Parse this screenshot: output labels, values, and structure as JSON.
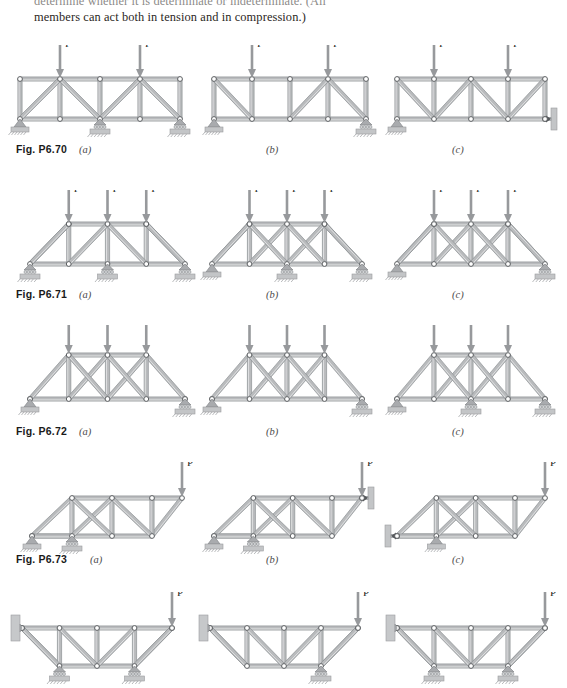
{
  "intro": {
    "line1": "determine whether it is determinate or indeterminate. (All",
    "line2": "members can act both in tension and in compression.)"
  },
  "load_label": "P",
  "colors": {
    "member": "#b9bbbd",
    "member_edge": "#8d9093",
    "joint_fill": "#ffffff",
    "joint_edge": "#5d6063",
    "support": "#a9abae",
    "arrow": "#97999c",
    "text": "#231f20"
  },
  "rows": [
    {
      "id": "p6-70",
      "fig_label": "Fig. P6.70",
      "fig_label_x": 16,
      "fig_label_y": 143,
      "top": 45,
      "panels": [
        {
          "id": "p6-70-a",
          "sub": "(a)",
          "sub_x": 79,
          "sub_y": 144,
          "x": 6,
          "type": "parallel-chord",
          "bays": 4,
          "span": 160,
          "height": 40,
          "diagonals": [
            "/",
            "\\",
            "/",
            "\\"
          ],
          "loads": [
            1,
            3
          ],
          "supports": [
            {
              "node": "bottom-0",
              "kind": "pin-ground"
            },
            {
              "node": "bottom-2",
              "kind": "roller-ground"
            },
            {
              "node": "bottom-4",
              "kind": "roller-ground"
            }
          ]
        },
        {
          "id": "p6-70-b",
          "sub": "(b)",
          "sub_x": 266,
          "sub_y": 144,
          "x": 200,
          "type": "parallel-chord",
          "bays": 4,
          "span": 152,
          "height": 40,
          "diagonals": [
            "\\",
            "",
            "/",
            "\\"
          ],
          "loads": [
            1,
            3
          ],
          "supports": [
            {
              "node": "bottom-0",
              "kind": "pin-ground"
            },
            {
              "node": "bottom-4",
              "kind": "roller-ground"
            }
          ]
        },
        {
          "id": "p6-70-c",
          "sub": "(c)",
          "sub_x": 452,
          "sub_y": 144,
          "x": 383,
          "type": "parallel-chord",
          "bays": 4,
          "span": 148,
          "height": 40,
          "diagonals": [
            "\\",
            "/",
            "\\",
            "/"
          ],
          "loads": [
            1,
            3
          ],
          "supports": [
            {
              "node": "bottom-0",
              "kind": "pin-ground"
            },
            {
              "node": "bottom-4",
              "kind": "link-wall-right"
            }
          ]
        }
      ]
    },
    {
      "id": "p6-71",
      "fig_label": "Fig. P6.71",
      "fig_label_x": 16,
      "fig_label_y": 288,
      "top": 190,
      "panels": [
        {
          "id": "p6-71-a",
          "sub": "(a)",
          "sub_x": 79,
          "sub_y": 289,
          "x": 16,
          "type": "trapezoid",
          "bays": 4,
          "span": 155,
          "height": 40,
          "overhang": 34,
          "diagonals": [
            "",
            "/",
            "\\",
            ""
          ],
          "loads": [
            1,
            2,
            3
          ],
          "supports": [
            {
              "node": "bottom-0",
              "kind": "roller-ground"
            },
            {
              "node": "bottom-2",
              "kind": "roller-ground"
            },
            {
              "node": "bottom-4",
              "kind": "roller-ground"
            }
          ]
        },
        {
          "id": "p6-71-b",
          "sub": "(b)",
          "sub_x": 266,
          "sub_y": 289,
          "x": 198,
          "type": "trapezoid",
          "bays": 4,
          "span": 150,
          "height": 40,
          "overhang": 34,
          "diagonals": [
            "",
            "X",
            "X",
            ""
          ],
          "loads": [
            1,
            2,
            3
          ],
          "supports": [
            {
              "node": "bottom-0",
              "kind": "pin-ground"
            },
            {
              "node": "bottom-2",
              "kind": "roller-ground"
            },
            {
              "node": "bottom-4",
              "kind": "roller-ground"
            }
          ]
        },
        {
          "id": "p6-71-c",
          "sub": "(c)",
          "sub_x": 452,
          "sub_y": 289,
          "x": 383,
          "type": "trapezoid",
          "bays": 4,
          "span": 148,
          "height": 40,
          "overhang": 34,
          "diagonals": [
            "",
            "X",
            "X",
            ""
          ],
          "loads": [
            1,
            2,
            3
          ],
          "supports": [
            {
              "node": "bottom-0",
              "kind": "pin-ground"
            },
            {
              "node": "bottom-4",
              "kind": "roller-ground"
            }
          ]
        }
      ]
    },
    {
      "id": "p6-72",
      "fig_label": "Fig. P6.72",
      "fig_label_x": 16,
      "fig_label_y": 425,
      "top": 325,
      "panels": [
        {
          "id": "p6-72-a",
          "sub": "(a)",
          "sub_x": 79,
          "sub_y": 426,
          "x": 16,
          "type": "gable",
          "bays": 4,
          "span": 155,
          "height": 44,
          "diagonals": [
            "",
            "X",
            "X",
            ""
          ],
          "loads": [
            1,
            2,
            3
          ],
          "supports": [
            {
              "node": "bottom-0",
              "kind": "pin-ground"
            },
            {
              "node": "bottom-4",
              "kind": "roller-ground"
            }
          ]
        },
        {
          "id": "p6-72-b",
          "sub": "(b)",
          "sub_x": 266,
          "sub_y": 426,
          "x": 198,
          "type": "gable-flat",
          "bays": 4,
          "span": 150,
          "height": 44,
          "diagonals": [
            "",
            "X",
            "X",
            ""
          ],
          "loads": [
            1,
            2,
            3
          ],
          "supports": [
            {
              "node": "bottom-0",
              "kind": "pin-ground"
            },
            {
              "node": "bottom-4",
              "kind": "roller-ground"
            }
          ]
        },
        {
          "id": "p6-72-c",
          "sub": "(c)",
          "sub_x": 452,
          "sub_y": 426,
          "x": 383,
          "type": "gable",
          "bays": 4,
          "span": 148,
          "height": 44,
          "diagonals": [
            "",
            "X",
            "X",
            ""
          ],
          "loads": [
            1,
            2,
            3
          ],
          "supports": [
            {
              "node": "bottom-0",
              "kind": "pin-ground"
            },
            {
              "node": "bottom-2",
              "kind": "roller-ground"
            },
            {
              "node": "bottom-4",
              "kind": "roller-ground"
            }
          ]
        }
      ]
    },
    {
      "id": "p6-73",
      "fig_label": "Fig. P6.73",
      "fig_label_x": 16,
      "fig_label_y": 553,
      "top": 462,
      "panels": [
        {
          "id": "p6-73-a",
          "sub": "(a)",
          "sub_x": 90,
          "sub_y": 554,
          "x": 18,
          "type": "cantilever",
          "bays": 3,
          "span": 120,
          "height": 38,
          "tip": 30,
          "diagonals": [
            "\\",
            "X",
            "\\"
          ],
          "loads": [
            "tip"
          ],
          "supports": [
            {
              "node": "bottom-0",
              "kind": "pin-ground"
            },
            {
              "node": "bottom-1",
              "kind": "roller-ground"
            }
          ]
        },
        {
          "id": "p6-73-b",
          "sub": "(b)",
          "sub_x": 266,
          "sub_y": 554,
          "x": 200,
          "type": "cantilever",
          "bays": 3,
          "span": 118,
          "height": 38,
          "tip": 30,
          "diagonals": [
            "\\",
            "X",
            "\\"
          ],
          "loads": [
            "tip"
          ],
          "supports": [
            {
              "node": "bottom-0",
              "kind": "pin-ground"
            },
            {
              "node": "bottom-1",
              "kind": "roller-ground"
            },
            {
              "node": "tip",
              "kind": "link-wall-right"
            }
          ]
        },
        {
          "id": "p6-73-c",
          "sub": "(c)",
          "sub_x": 452,
          "sub_y": 554,
          "x": 383,
          "type": "cantilever",
          "bays": 3,
          "span": 118,
          "height": 38,
          "tip": 30,
          "diagonals": [
            "\\",
            "X",
            "\\"
          ],
          "loads": [
            "tip"
          ],
          "supports": [
            {
              "node": "bottom-0",
              "kind": "link-wall-left"
            },
            {
              "node": "bottom-1",
              "kind": "pin-ground"
            }
          ]
        }
      ]
    },
    {
      "id": "p6-74",
      "fig_label": "",
      "fig_label_x": 16,
      "fig_label_y": 690,
      "top": 592,
      "panels": [
        {
          "id": "p6-74-a",
          "sub": "",
          "sub_x": 79,
          "sub_y": 690,
          "x": 8,
          "type": "wall-cantilever",
          "bays": 4,
          "span": 150,
          "height": 38,
          "diagonals": [
            "\\",
            "\\",
            "/",
            "/"
          ],
          "loads": [
            "tip"
          ],
          "supports": [
            {
              "node": "top-0",
              "kind": "wall-left"
            },
            {
              "node": "bottom-1",
              "kind": "roller-ground"
            },
            {
              "node": "bottom-3",
              "kind": "roller-ground"
            }
          ]
        },
        {
          "id": "p6-74-b",
          "sub": "",
          "sub_x": 266,
          "sub_y": 690,
          "x": 196,
          "type": "wall-cantilever",
          "bays": 4,
          "span": 148,
          "height": 38,
          "diagonals": [
            "\\",
            "\\",
            "/",
            "/"
          ],
          "loads": [
            "tip"
          ],
          "supports": [
            {
              "node": "top-0",
              "kind": "wall-left"
            },
            {
              "node": "bottom-3",
              "kind": "roller-ground"
            }
          ]
        },
        {
          "id": "p6-74-c",
          "sub": "",
          "sub_x": 452,
          "sub_y": 690,
          "x": 383,
          "type": "wall-cantilever",
          "bays": 4,
          "span": 148,
          "height": 38,
          "diagonals": [
            "\\",
            "\\",
            "/",
            "/"
          ],
          "loads": [
            "tip"
          ],
          "supports": [
            {
              "node": "top-0",
              "kind": "wall-left"
            },
            {
              "node": "bottom-1",
              "kind": "roller-ground"
            },
            {
              "node": "bottom-3",
              "kind": "roller-ground"
            }
          ]
        }
      ]
    }
  ],
  "chart_data": {
    "type": "diagram",
    "figures": [
      "Fig. P6.70",
      "Fig. P6.71",
      "Fig. P6.72",
      "Fig. P6.73"
    ],
    "parts": [
      "(a)",
      "(b)",
      "(c)"
    ],
    "load_symbol": "P"
  }
}
